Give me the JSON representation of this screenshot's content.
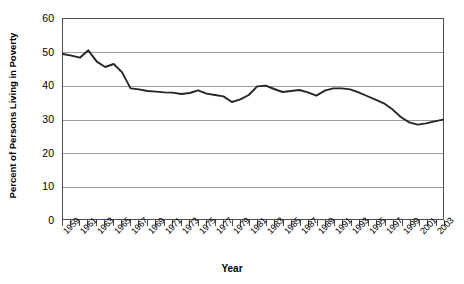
{
  "chart_data": {
    "type": "line",
    "title": "",
    "xlabel": "Year",
    "ylabel": "Percent of Persons Living in Poverty",
    "xlim": [
      1959,
      2004
    ],
    "ylim": [
      0,
      60
    ],
    "ytick_labels": [
      "0",
      "10",
      "20",
      "30",
      "40",
      "50",
      "60"
    ],
    "ytick_values": [
      0,
      10,
      20,
      30,
      40,
      50,
      60
    ],
    "grid": true,
    "legend": "none",
    "line_color": "#262626",
    "x": [
      1959,
      1960,
      1961,
      1962,
      1963,
      1964,
      1965,
      1966,
      1967,
      1968,
      1969,
      1970,
      1971,
      1972,
      1973,
      1974,
      1975,
      1976,
      1977,
      1978,
      1979,
      1980,
      1981,
      1982,
      1983,
      1984,
      1985,
      1986,
      1987,
      1988,
      1989,
      1990,
      1991,
      1992,
      1993,
      1994,
      1995,
      1996,
      1997,
      1998,
      1999,
      2000,
      2001,
      2002,
      2003,
      2004
    ],
    "xtick_labels": [
      "1959",
      "1961",
      "1963",
      "1965",
      "1967",
      "1969",
      "1971",
      "1973",
      "1975",
      "1977",
      "1979",
      "1981",
      "1983",
      "1985",
      "1987",
      "1989",
      "1991",
      "1993",
      "1995",
      "1997",
      "1999",
      "2001",
      "2003"
    ],
    "values": [
      49.5,
      49.0,
      48.4,
      50.6,
      47.2,
      45.6,
      46.5,
      44.0,
      39.2,
      38.9,
      38.4,
      38.2,
      38.0,
      37.9,
      37.5,
      37.8,
      38.6,
      37.6,
      37.2,
      36.8,
      35.1,
      35.9,
      37.2,
      39.8,
      40.0,
      39.0,
      38.1,
      38.4,
      38.7,
      38.0,
      37.0,
      38.5,
      39.2,
      39.2,
      38.9,
      38.0,
      36.9,
      35.8,
      34.7,
      32.9,
      30.6,
      29.0,
      28.3,
      28.7,
      29.3,
      29.8
    ]
  }
}
